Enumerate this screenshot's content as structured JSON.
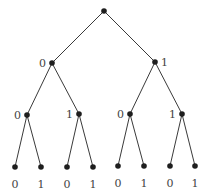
{
  "diagram": {
    "type": "binary-tree",
    "levels": 4,
    "nodes": [
      {
        "id": "root",
        "x": 104,
        "y": 11,
        "label": ""
      },
      {
        "id": "n0",
        "x": 52,
        "y": 63,
        "label": "0",
        "label_pos": "left"
      },
      {
        "id": "n1",
        "x": 155,
        "y": 62,
        "label": "1",
        "label_pos": "right"
      },
      {
        "id": "n00",
        "x": 27,
        "y": 115,
        "label": "0",
        "label_pos": "left"
      },
      {
        "id": "n01",
        "x": 79,
        "y": 114,
        "label": "1",
        "label_pos": "left"
      },
      {
        "id": "n10",
        "x": 130,
        "y": 114,
        "label": "0",
        "label_pos": "left"
      },
      {
        "id": "n11",
        "x": 182,
        "y": 114,
        "label": "1",
        "label_pos": "left"
      },
      {
        "id": "n000",
        "x": 15,
        "y": 167,
        "label": "0",
        "label_pos": "below"
      },
      {
        "id": "n001",
        "x": 41,
        "y": 167,
        "label": "1",
        "label_pos": "below"
      },
      {
        "id": "n010",
        "x": 67,
        "y": 167,
        "label": "0",
        "label_pos": "below"
      },
      {
        "id": "n011",
        "x": 93,
        "y": 167,
        "label": "1",
        "label_pos": "below"
      },
      {
        "id": "n100",
        "x": 118,
        "y": 166,
        "label": "0",
        "label_pos": "below"
      },
      {
        "id": "n101",
        "x": 144,
        "y": 166,
        "label": "1",
        "label_pos": "below"
      },
      {
        "id": "n110",
        "x": 170,
        "y": 166,
        "label": "0",
        "label_pos": "below"
      },
      {
        "id": "n111",
        "x": 195,
        "y": 166,
        "label": "1",
        "label_pos": "below"
      }
    ],
    "edges": [
      [
        "root",
        "n0"
      ],
      [
        "root",
        "n1"
      ],
      [
        "n0",
        "n00"
      ],
      [
        "n0",
        "n01"
      ],
      [
        "n1",
        "n10"
      ],
      [
        "n1",
        "n11"
      ],
      [
        "n00",
        "n000"
      ],
      [
        "n00",
        "n001"
      ],
      [
        "n01",
        "n010"
      ],
      [
        "n01",
        "n011"
      ],
      [
        "n10",
        "n100"
      ],
      [
        "n10",
        "n101"
      ],
      [
        "n11",
        "n110"
      ],
      [
        "n11",
        "n111"
      ]
    ],
    "colors": {
      "node": "#1e1e1e",
      "edge": "#3a3a3a",
      "label": "#444444"
    }
  }
}
